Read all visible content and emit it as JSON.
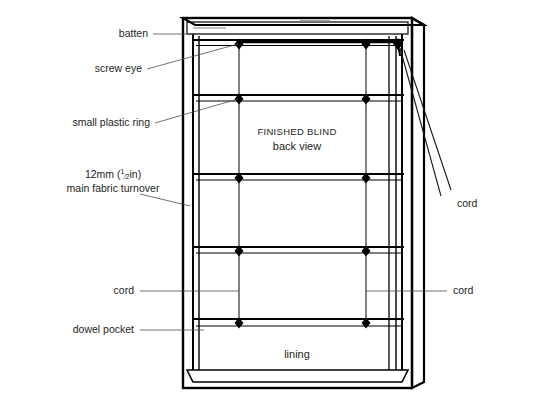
{
  "diagram": {
    "title_main": "FINISHED BLIND",
    "title_sub": "back view",
    "lining_label": "lining",
    "labels": {
      "batten": "batten",
      "screw_eye": "screw eye",
      "small_plastic_ring": "small plastic ring",
      "turnover_line1_prefix": "12mm (",
      "turnover_frac_num": "1",
      "turnover_frac_slash": "⁄",
      "turnover_frac_den": "2",
      "turnover_line1_suffix": "in)",
      "turnover_line2": "main fabric turnover",
      "cord_left": "cord",
      "cord_right": "cord",
      "cord_top_right": "cord",
      "dowel_pocket": "dowel pocket"
    },
    "colors": {
      "background": "#ffffff",
      "ink": "#000000",
      "text": "#231f20",
      "leader": "#4d4d4d"
    },
    "geometry": {
      "blind_left": 183,
      "blind_right": 412,
      "blind_top": 18,
      "blind_bottom": 388,
      "cord_columns_x": [
        239,
        366
      ],
      "ring_rows_y": [
        44,
        99,
        178,
        251,
        323
      ],
      "row_count": 5,
      "cord_column_count": 2
    }
  }
}
